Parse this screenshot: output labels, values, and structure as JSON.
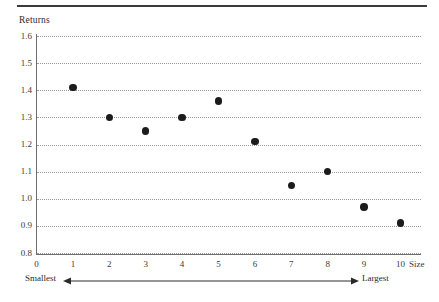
{
  "chart_data": {
    "type": "scatter",
    "title": "",
    "xlabel": "Size",
    "ylabel": "Returns",
    "xlim": [
      0,
      10
    ],
    "ylim": [
      0.75,
      1.62
    ],
    "grid": true,
    "legend": "none",
    "x_tick_labels": [
      "0",
      "1",
      "2",
      "3",
      "4",
      "5",
      "6",
      "7",
      "8",
      "9",
      "10"
    ],
    "y_tick_labels": [
      "0.8",
      "0.9",
      "1.0",
      "1.1",
      "1.2",
      "1.3",
      "1.4",
      "1.5",
      "1.6"
    ],
    "y_ticks": [
      0.8,
      0.9,
      1.0,
      1.1,
      1.2,
      1.3,
      1.4,
      1.5,
      1.6
    ],
    "x": [
      1,
      2,
      3,
      4,
      5,
      6,
      7,
      8,
      9,
      10
    ],
    "values": [
      1.41,
      1.3,
      1.25,
      1.3,
      1.36,
      1.21,
      1.05,
      1.1,
      0.97,
      0.91
    ],
    "marker": "filled-circle",
    "marker_color": "#1c1c1c",
    "annotations": {
      "left_label": "Smallest",
      "right_label": "Largest",
      "arrow": "double-headed-horizontal-arrow"
    }
  },
  "axes": {
    "y_title": "Returns",
    "x_title": "Size",
    "y_ticks": [
      {
        "label": "1.6",
        "value": 1.6
      },
      {
        "label": "1.5",
        "value": 1.5
      },
      {
        "label": "1.4",
        "value": 1.4
      },
      {
        "label": "1.3",
        "value": 1.3
      },
      {
        "label": "1.2",
        "value": 1.2
      },
      {
        "label": "1.1",
        "value": 1.1
      },
      {
        "label": "1.0",
        "value": 1.0
      },
      {
        "label": "0.9",
        "value": 0.9
      },
      {
        "label": "0.8",
        "value": 0.8
      }
    ],
    "x_ticks": [
      {
        "label": "0",
        "value": 0
      },
      {
        "label": "1",
        "value": 1
      },
      {
        "label": "2",
        "value": 2
      },
      {
        "label": "3",
        "value": 3
      },
      {
        "label": "4",
        "value": 4
      },
      {
        "label": "5",
        "value": 5
      },
      {
        "label": "6",
        "value": 6
      },
      {
        "label": "7",
        "value": 7
      },
      {
        "label": "8",
        "value": 8
      },
      {
        "label": "9",
        "value": 9
      },
      {
        "label": "10",
        "value": 10
      }
    ]
  },
  "direction": {
    "smallest": "Smallest",
    "largest": "Largest"
  },
  "colors": {
    "rule": "#3a3a3a",
    "axis": "#6e6e6e",
    "grid": "#9a9a9a",
    "marker": "#1c1c1c",
    "text": "#2b2b2b"
  }
}
